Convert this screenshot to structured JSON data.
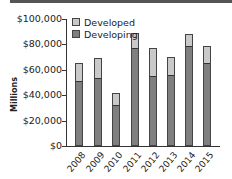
{
  "chart_data": {
    "type": "bar",
    "stacked": true,
    "title": "",
    "xlabel": "",
    "ylabel": "Millions",
    "ylim": [
      0,
      100000
    ],
    "yticks": [
      "$0",
      "$20,000",
      "$40,000",
      "$60,000",
      "$80,000",
      "$100,000"
    ],
    "categories": [
      "2008",
      "2009",
      "2010",
      "2011",
      "2012",
      "2013",
      "2014",
      "2015"
    ],
    "series": [
      {
        "name": "Developing",
        "color": "#7f7f7f",
        "values": [
          51000,
          53500,
          32000,
          77000,
          55000,
          56000,
          79000,
          65000
        ]
      },
      {
        "name": "Developed",
        "color": "#c9c9c9",
        "values": [
          14500,
          15500,
          9500,
          12000,
          22500,
          14000,
          9000,
          14000
        ]
      }
    ],
    "legend": [
      "Developed",
      "Developing"
    ],
    "legend_position": "top-left",
    "grid": false
  },
  "labels": {
    "y": [
      "$0",
      "$20,000",
      "$40,000",
      "$60,000",
      "$80,000",
      "$100,000"
    ],
    "ytitle": "Millions",
    "legend_developed": "Developed",
    "legend_developing": "Developing"
  }
}
